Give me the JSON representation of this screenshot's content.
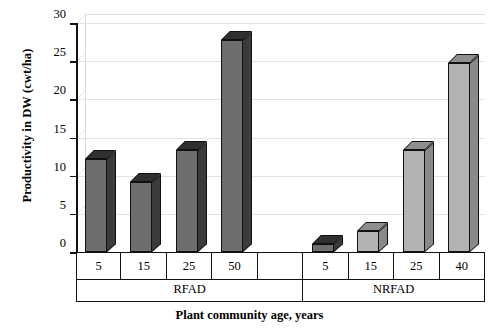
{
  "chart_data": {
    "type": "bar",
    "title": "",
    "xlabel": "Plant community age, years",
    "ylabel": "Productivity in DW (cwt/ha)",
    "ylim": [
      0,
      30
    ],
    "yticks": [
      0,
      5,
      10,
      15,
      20,
      25,
      30
    ],
    "grid": true,
    "legend": "none",
    "style": "3d-column",
    "groups": [
      {
        "name": "RFAD",
        "color": "#6e6e6e",
        "categories": [
          "5",
          "15",
          "25",
          "50",
          ""
        ],
        "values": [
          12.2,
          9.2,
          13.3,
          27.8,
          null
        ]
      },
      {
        "name": "NRFAD",
        "color": "#b2b2b2",
        "categories": [
          "5",
          "15",
          "25",
          "40"
        ],
        "values": [
          1.0,
          2.8,
          13.3,
          24.8
        ]
      }
    ],
    "categories": [
      "5",
      "15",
      "25",
      "50",
      "",
      "5",
      "15",
      "25",
      "40"
    ],
    "values": [
      12.2,
      9.2,
      13.3,
      27.8,
      null,
      1.0,
      2.8,
      13.3,
      24.8
    ],
    "colors": {
      "rfad_fill": "#6e6e6e",
      "nrfad_fill": "#b2b2b2",
      "outline": "#101010",
      "gridline": "#e2e2e2",
      "axis": "#111111"
    }
  }
}
